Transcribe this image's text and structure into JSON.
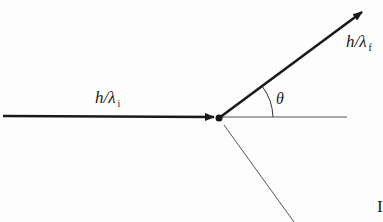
{
  "diagram": {
    "type": "compton-scattering-vector-diagram",
    "labels": {
      "incident_momentum": {
        "main": "h/λ",
        "sub": "i"
      },
      "scattered_momentum": {
        "main": "h/λ",
        "sub": "f"
      },
      "scatter_angle": "θ",
      "edge_glyph": "I"
    },
    "elements": {
      "incident_arrow": {
        "from": [
          3,
          116
        ],
        "to": [
          214,
          117
        ]
      },
      "scattered_arrow": {
        "from": [
          219,
          118
        ],
        "to": [
          362,
          12
        ]
      },
      "reference_line": {
        "from": [
          219,
          117
        ],
        "to": [
          347,
          117
        ]
      },
      "recoil_line": {
        "from": [
          224,
          125
        ],
        "to": [
          294,
          222
        ]
      },
      "vertex": {
        "x": 219,
        "y": 118
      },
      "angle_arc": {
        "center": [
          219,
          118
        ],
        "radius": 54
      }
    },
    "colors": {
      "line": "#1a1a1a",
      "thin_line": "#555555",
      "background": "#fdfdfd"
    }
  }
}
